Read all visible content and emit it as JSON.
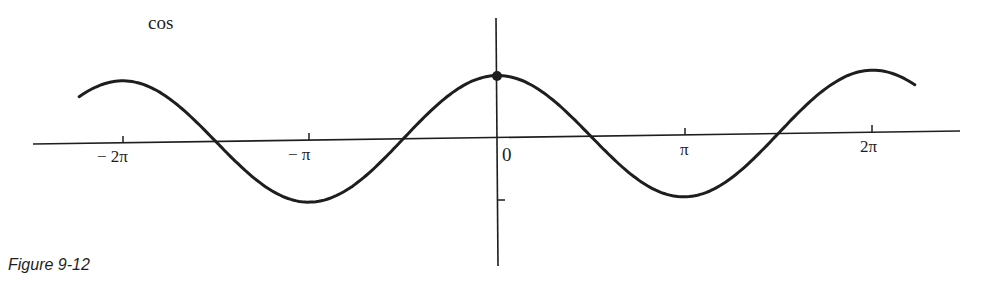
{
  "figure": {
    "function_label": "cos",
    "caption": "Figure 9-12",
    "ink_color": "#1e1e1e",
    "background_color": "#ffffff"
  },
  "axes": {
    "x_tick_labels": [
      "− 2π",
      "− π",
      "0",
      "π",
      "2π"
    ]
  },
  "chart_data": {
    "type": "line",
    "title": "cos",
    "caption": "Figure 9-12",
    "xlabel": "",
    "ylabel": "",
    "x_ticks": [
      -6.2832,
      -3.1416,
      0,
      3.1416,
      6.2832
    ],
    "x_tick_labels": [
      "-2π",
      "-π",
      "0",
      "π",
      "2π"
    ],
    "y_ticks": [
      -1
    ],
    "xlim": [
      -7.4,
      7.9
    ],
    "ylim": [
      -1.4,
      1.7
    ],
    "grid": false,
    "legend": null,
    "highlighted_point": {
      "x": 0,
      "y": 1
    },
    "series": [
      {
        "name": "cos(x)",
        "x": [
          -7.0,
          -6.2832,
          -4.7124,
          -3.1416,
          -1.5708,
          0,
          1.5708,
          3.1416,
          4.7124,
          6.2832,
          7.0
        ],
        "values": [
          0.754,
          1,
          0,
          -1,
          0,
          1,
          0,
          -1,
          0,
          1,
          0.754
        ]
      }
    ]
  }
}
